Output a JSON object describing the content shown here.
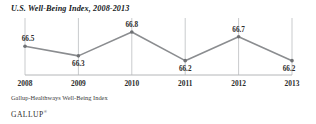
{
  "chart_data": {
    "type": "line",
    "title": "U.S. Well-Being Index, 2008-2013",
    "xlabel": "",
    "ylabel": "",
    "categories": [
      "2008",
      "2009",
      "2010",
      "2011",
      "2012",
      "2013"
    ],
    "values": [
      66.5,
      66.3,
      66.8,
      66.2,
      66.7,
      66.2
    ],
    "point_labels": [
      "66.5",
      "66.3",
      "66.8",
      "66.2",
      "66.7",
      "66.2"
    ],
    "label_positions": [
      "above",
      "below",
      "above",
      "below",
      "above",
      "below"
    ],
    "ylim": [
      65.9,
      67.05
    ],
    "grid": "vertical",
    "legend": "none",
    "series": [
      {
        "name": "U.S. Well-Being Index",
        "values": [
          66.5,
          66.3,
          66.8,
          66.2,
          66.7,
          66.2
        ],
        "color": "#8b8d90"
      }
    ],
    "colors": {
      "line": "#8b8d90",
      "marker": "#6f7174",
      "gridline": "#c9cbcd",
      "baseline": "#b4b6b8",
      "text": "#2b2b2b",
      "title": "#15181c"
    }
  },
  "source_note": "Gallup-Healthways Well-Being Index",
  "brand": {
    "name": "GALLUP",
    "trademark": "®"
  }
}
